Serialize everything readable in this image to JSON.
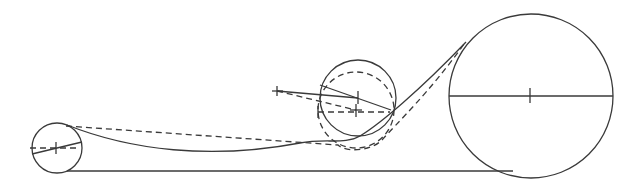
{
  "diagram": {
    "type": "belt-drive-tensioner",
    "colors": {
      "stroke": "#3a3a3a",
      "background": "#ffffff"
    },
    "components": [
      {
        "id": "small-pulley",
        "cx": 57,
        "cy": 148,
        "r": 25
      },
      {
        "id": "large-pulley",
        "cx": 531,
        "cy": 96,
        "r": 82
      },
      {
        "id": "idler-solid",
        "cx": 358,
        "cy": 98,
        "r": 38
      },
      {
        "id": "idler-dashed",
        "cx": 356,
        "cy": 110,
        "r": 38
      },
      {
        "id": "pivot",
        "x": 277,
        "y": 91
      }
    ],
    "labels": []
  }
}
